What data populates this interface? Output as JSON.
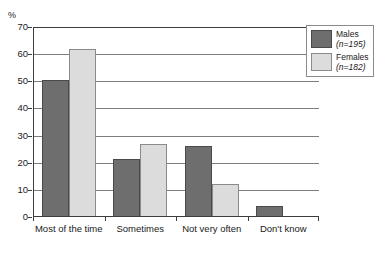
{
  "figure_label": "",
  "chart_data": {
    "type": "bar",
    "title": "",
    "subtitle": "",
    "xlabel": "",
    "ylabel": "%",
    "ylim": [
      0,
      70
    ],
    "ytick_step": 10,
    "yticks": [
      0,
      10,
      20,
      30,
      40,
      50,
      60,
      70
    ],
    "grid": true,
    "grid_axis": "y",
    "legend_position": "top-right",
    "categories": [
      "Most of the time",
      "Sometimes",
      "Not very often",
      "Don't know"
    ],
    "series": [
      {
        "name": "Males",
        "n": 195,
        "legend_label": "Males",
        "legend_n": "(n=195)",
        "color": "#6e6e6e",
        "values": [
          50.5,
          21.5,
          26,
          4
        ]
      },
      {
        "name": "Females",
        "n": 182,
        "legend_label": "Females",
        "legend_n": "(n=182)",
        "color": "#dcdcdc",
        "values": [
          62,
          27,
          12,
          0
        ]
      }
    ]
  },
  "colors": {
    "males": "#6e6e6e",
    "females": "#dcdcdc",
    "axis": "#3d3d3d",
    "gridline": "#7d7d7d",
    "background": "#ffffff",
    "text": "#1a1a1a"
  }
}
